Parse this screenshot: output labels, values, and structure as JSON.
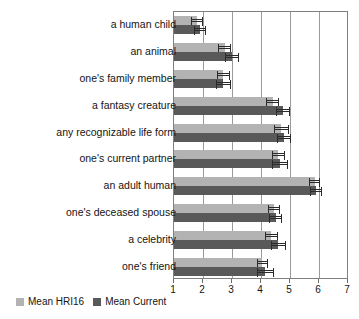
{
  "chart_data": {
    "type": "bar",
    "orientation": "horizontal",
    "title": "",
    "xlabel": "",
    "ylabel": "",
    "xlim": [
      1,
      7
    ],
    "xticks": [
      1,
      2,
      3,
      4,
      5,
      6,
      7
    ],
    "grid": true,
    "legend_position": "bottom-left",
    "categories": [
      "a human child",
      "an animal",
      "one's family member",
      "a fantasy creature",
      "any recognizable life form",
      "one's current partner",
      "an adult human",
      "one's deceased spouse",
      "a celebrity",
      "one's friend"
    ],
    "series": [
      {
        "name": "Mean HRI16",
        "color": "#b3b3b3",
        "values": [
          1.8,
          2.75,
          2.7,
          4.4,
          4.7,
          4.6,
          5.85,
          4.45,
          4.35,
          4.05
        ],
        "errors": [
          0.2,
          0.22,
          0.22,
          0.22,
          0.25,
          0.22,
          0.2,
          0.2,
          0.22,
          0.2
        ]
      },
      {
        "name": "Mean Current",
        "color": "#595959",
        "values": [
          1.9,
          3.0,
          2.7,
          4.75,
          4.8,
          4.65,
          5.9,
          4.5,
          4.6,
          4.15
        ],
        "errors": [
          0.22,
          0.25,
          0.25,
          0.25,
          0.25,
          0.28,
          0.22,
          0.22,
          0.25,
          0.3
        ]
      }
    ]
  },
  "legend": {
    "items": [
      {
        "label": "Mean HRI16"
      },
      {
        "label": "Mean Current"
      }
    ]
  }
}
